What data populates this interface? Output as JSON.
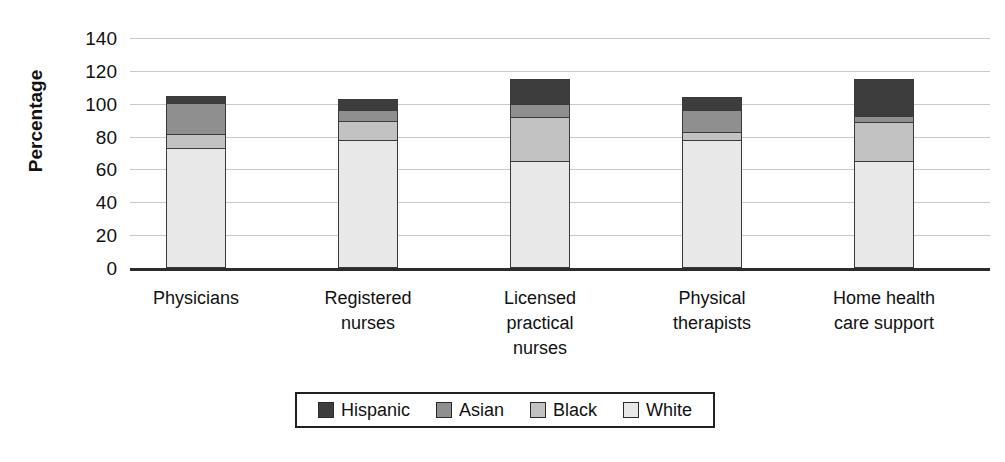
{
  "chart_data": {
    "type": "bar",
    "subtype": "stacked-bar",
    "title": "",
    "xlabel": "",
    "ylabel": "Percentage",
    "ylim": [
      0,
      140
    ],
    "ytick_step": 20,
    "yticks": [
      "140",
      "120",
      "100",
      "80",
      "60",
      "40",
      "20",
      "0"
    ],
    "grid": true,
    "legend_position": "bottom",
    "categories": [
      "Physicians",
      "Registered nurses",
      "Licensed practical nurses",
      "Physical therapists",
      "Home health care support"
    ],
    "category_label_lines": [
      [
        "Physicians"
      ],
      [
        "Registered",
        "nurses"
      ],
      [
        "Licensed",
        "practical",
        "nurses"
      ],
      [
        "Physical",
        "therapists"
      ],
      [
        "Home health",
        "care support"
      ]
    ],
    "series": [
      {
        "name": "White",
        "color": "#e8e8e8",
        "values": [
          73,
          78,
          65,
          78,
          65
        ]
      },
      {
        "name": "Black",
        "color": "#c2c2c2",
        "values": [
          9,
          12,
          27,
          5,
          24
        ]
      },
      {
        "name": "Asian",
        "color": "#8f8f8f",
        "values": [
          19,
          7,
          8,
          14,
          4
        ]
      },
      {
        "name": "Hispanic",
        "color": "#3d3d3d",
        "values": [
          4,
          6,
          15,
          7,
          22
        ]
      }
    ],
    "totals": [
      105,
      103,
      115,
      104,
      115
    ],
    "stack_order_bottom_to_top": [
      "White",
      "Black",
      "Asian",
      "Hispanic"
    ]
  },
  "legend": {
    "items": [
      {
        "label": "Hispanic",
        "color": "#3d3d3d"
      },
      {
        "label": "Asian",
        "color": "#8f8f8f"
      },
      {
        "label": "Black",
        "color": "#c2c2c2"
      },
      {
        "label": "White",
        "color": "#e8e8e8"
      }
    ]
  },
  "axis": {
    "y_title": "Percentage"
  }
}
